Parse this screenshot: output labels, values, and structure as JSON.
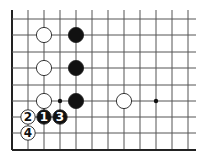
{
  "diagram": {
    "type": "go-board-fragment",
    "background": "#ffffff",
    "line_color": "#555555",
    "edge_color": "#222222",
    "grid": {
      "x0": 12,
      "dx": 16,
      "cols": 12,
      "rows_y": [
        19,
        35,
        52,
        68,
        85,
        101,
        117,
        133,
        150
      ],
      "right_extent": 196,
      "top_extent": 10,
      "left_edge": true,
      "bottom_edge": true
    },
    "star_points": [
      {
        "col": 3,
        "row": 5
      },
      {
        "col": 9,
        "row": 5
      }
    ],
    "stones": [
      {
        "color": "white",
        "col": 2,
        "row": 1,
        "label": ""
      },
      {
        "color": "white",
        "col": 2,
        "row": 3,
        "label": ""
      },
      {
        "color": "white",
        "col": 2,
        "row": 5,
        "label": ""
      },
      {
        "color": "black",
        "col": 4,
        "row": 1,
        "label": ""
      },
      {
        "color": "black",
        "col": 4,
        "row": 3,
        "label": ""
      },
      {
        "color": "black",
        "col": 4,
        "row": 5,
        "label": ""
      },
      {
        "color": "white",
        "col": 7,
        "row": 5,
        "label": ""
      }
    ],
    "numbered_moves": [
      {
        "color": "black",
        "col": 2,
        "row": 6,
        "label": "1"
      },
      {
        "color": "white",
        "col": 1,
        "row": 6,
        "label": "2"
      },
      {
        "color": "black",
        "col": 3,
        "row": 6,
        "label": "3"
      },
      {
        "color": "white",
        "col": 1,
        "row": 7,
        "label": "4"
      }
    ]
  }
}
